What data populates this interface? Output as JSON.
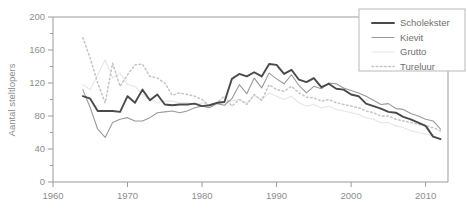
{
  "chart_data": {
    "type": "line",
    "title": "",
    "xlabel": "",
    "ylabel": "Aantal steltlopers",
    "xlim": [
      1960,
      2013
    ],
    "ylim": [
      0,
      200
    ],
    "xticks": [
      1960,
      1970,
      1980,
      1990,
      2000,
      2010
    ],
    "xtick_labels": [
      "1960",
      "1970",
      "1980",
      "1990",
      "2000",
      "2010"
    ],
    "yticks": [
      0,
      40,
      80,
      120,
      160,
      200
    ],
    "ytick_labels": [
      "0",
      "40",
      "80",
      "120",
      "160",
      "200"
    ],
    "minor_yticks": [
      20,
      60,
      100,
      140,
      180
    ],
    "grid": false,
    "legend_position": "top-right",
    "series": [
      {
        "name": "Scholekster",
        "style": "solid",
        "color": "#4a4a4a",
        "width": 1.9,
        "x": [
          1964,
          1965,
          1966,
          1967,
          1968,
          1969,
          1970,
          1971,
          1972,
          1973,
          1974,
          1975,
          1976,
          1977,
          1978,
          1979,
          1980,
          1981,
          1982,
          1983,
          1984,
          1985,
          1986,
          1987,
          1988,
          1989,
          1990,
          1991,
          1992,
          1993,
          1994,
          1995,
          1996,
          1997,
          1998,
          1999,
          2000,
          2001,
          2002,
          2003,
          2004,
          2005,
          2006,
          2007,
          2008,
          2009,
          2010,
          2011,
          2012
        ],
        "y": [
          104,
          101,
          86,
          86,
          86,
          85,
          104,
          96,
          112,
          99,
          106,
          94,
          93,
          94,
          94,
          95,
          92,
          93,
          96,
          97,
          125,
          131,
          128,
          133,
          128,
          143,
          142,
          131,
          136,
          124,
          121,
          126,
          115,
          119,
          113,
          112,
          106,
          104,
          95,
          92,
          89,
          85,
          84,
          79,
          76,
          72,
          68,
          55,
          52
        ]
      },
      {
        "name": "Kievit",
        "style": "solid",
        "color": "#9a9a9a",
        "width": 1.1,
        "x": [
          1964,
          1965,
          1966,
          1967,
          1968,
          1969,
          1970,
          1971,
          1972,
          1973,
          1974,
          1975,
          1976,
          1977,
          1978,
          1979,
          1980,
          1981,
          1982,
          1983,
          1984,
          1985,
          1986,
          1987,
          1988,
          1989,
          1990,
          1991,
          1992,
          1993,
          1994,
          1995,
          1996,
          1997,
          1998,
          1999,
          2000,
          2001,
          2002,
          2003,
          2004,
          2005,
          2006,
          2007,
          2008,
          2009,
          2010,
          2011,
          2012
        ],
        "y": [
          112,
          90,
          64,
          54,
          72,
          76,
          78,
          74,
          74,
          78,
          84,
          85,
          86,
          84,
          86,
          90,
          92,
          90,
          95,
          93,
          101,
          118,
          107,
          126,
          114,
          132,
          125,
          119,
          130,
          117,
          108,
          116,
          113,
          120,
          119,
          114,
          111,
          108,
          104,
          99,
          94,
          95,
          89,
          88,
          83,
          80,
          76,
          74,
          64
        ]
      },
      {
        "name": "Grutto",
        "style": "solid",
        "color": "#e6e6e6",
        "width": 1.1,
        "x": [
          1964,
          1965,
          1966,
          1967,
          1968,
          1969,
          1970,
          1971,
          1972,
          1973,
          1974,
          1975,
          1976,
          1977,
          1978,
          1979,
          1980,
          1981,
          1982,
          1983,
          1984,
          1985,
          1986,
          1987,
          1988,
          1989,
          1990,
          1991,
          1992,
          1993,
          1994,
          1995,
          1996,
          1997,
          1998,
          1999,
          2000,
          2001,
          2002,
          2003,
          2004,
          2005,
          2006,
          2007,
          2008,
          2009,
          2010,
          2011,
          2012
        ],
        "y": [
          118,
          112,
          130,
          148,
          126,
          132,
          118,
          116,
          106,
          100,
          96,
          98,
          98,
          96,
          96,
          94,
          96,
          94,
          95,
          97,
          98,
          100,
          96,
          104,
          100,
          108,
          104,
          100,
          104,
          96,
          92,
          94,
          90,
          92,
          88,
          86,
          84,
          82,
          78,
          76,
          72,
          72,
          68,
          66,
          62,
          60,
          58,
          56,
          52
        ]
      },
      {
        "name": "Tureluur",
        "style": "dotted",
        "color": "#c4c4c4",
        "width": 1.5,
        "x": [
          1964,
          1965,
          1966,
          1967,
          1968,
          1969,
          1970,
          1971,
          1972,
          1973,
          1974,
          1975,
          1976,
          1977,
          1978,
          1979,
          1980,
          1981,
          1982,
          1983,
          1984,
          1985,
          1986,
          1987,
          1988,
          1989,
          1990,
          1991,
          1992,
          1993,
          1994,
          1995,
          1996,
          1997,
          1998,
          1999,
          2000,
          2001,
          2002,
          2003,
          2004,
          2005,
          2006,
          2007,
          2008,
          2009,
          2010,
          2011,
          2012
        ],
        "y": [
          175,
          150,
          120,
          96,
          144,
          116,
          130,
          142,
          143,
          128,
          126,
          120,
          105,
          108,
          106,
          104,
          100,
          92,
          96,
          104,
          92,
          100,
          94,
          106,
          99,
          118,
          112,
          110,
          116,
          108,
          103,
          102,
          98,
          100,
          96,
          94,
          92,
          90,
          86,
          84,
          80,
          80,
          76,
          74,
          72,
          70,
          68,
          66,
          62
        ]
      }
    ]
  },
  "legend": {
    "items": [
      {
        "label": "Scholekster"
      },
      {
        "label": "Kievit"
      },
      {
        "label": "Grutto"
      },
      {
        "label": "Tureluur"
      }
    ]
  }
}
